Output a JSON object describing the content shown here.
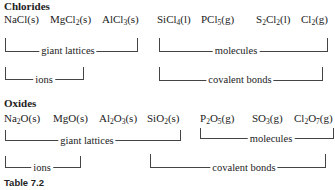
{
  "sections": {
    "chlorides": {
      "title": "Chlorides",
      "formulas": [
        {
          "parts": [
            [
              "NaCl(s)",
              null
            ]
          ]
        },
        {
          "parts": [
            [
              "MgCl",
              "2"
            ],
            [
              "(s)",
              null
            ]
          ]
        },
        {
          "parts": [
            [
              "AlCl",
              "3"
            ],
            [
              "(s)",
              null
            ]
          ]
        },
        {
          "parts": [
            [
              "SiCl",
              "4"
            ],
            [
              "(l)",
              null
            ]
          ]
        },
        {
          "parts": [
            [
              "PCl",
              "5"
            ],
            [
              "(g)",
              null
            ]
          ]
        },
        {
          "parts": [
            [
              "S",
              "2"
            ],
            [
              "Cl",
              "2"
            ],
            [
              "(l)",
              null
            ]
          ]
        },
        {
          "parts": [
            [
              "Cl",
              "2"
            ],
            [
              "(g)",
              null
            ]
          ]
        }
      ],
      "brackets": {
        "giant_lattices": "giant lattices",
        "molecules": "molecules",
        "ions": "ions",
        "covalent_bonds": "covalent bonds"
      }
    },
    "oxides": {
      "title": "Oxides",
      "formulas": [
        {
          "parts": [
            [
              "Na",
              "2"
            ],
            [
              "O(s)",
              null
            ]
          ]
        },
        {
          "parts": [
            [
              "MgO(s)",
              null
            ]
          ]
        },
        {
          "parts": [
            [
              "Al",
              "2"
            ],
            [
              "O",
              "3"
            ],
            [
              "(s)",
              null
            ]
          ]
        },
        {
          "parts": [
            [
              "SiO",
              "2"
            ],
            [
              "(s)",
              null
            ]
          ]
        },
        {
          "parts": [
            [
              "P",
              "2"
            ],
            [
              "O",
              "5"
            ],
            [
              "(g)",
              null
            ]
          ]
        },
        {
          "parts": [
            [
              "SO",
              "3"
            ],
            [
              "(g)",
              null
            ]
          ]
        },
        {
          "parts": [
            [
              "Cl",
              "2"
            ],
            [
              "O",
              "7"
            ],
            [
              "(g)",
              null
            ]
          ]
        }
      ],
      "brackets": {
        "giant_lattices": "giant lattices",
        "molecules": "molecules",
        "ions": "ions",
        "covalent_bonds": "covalent bonds"
      }
    }
  },
  "caption": "Table 7.2"
}
